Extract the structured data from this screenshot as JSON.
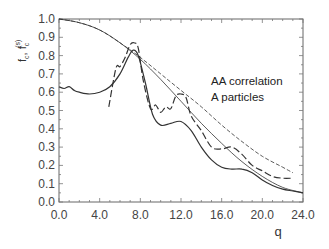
{
  "chart_data": {
    "type": "line",
    "title": "",
    "xlabel": "q",
    "ylabel": "f_c, f_c^(s)",
    "xlim": [
      0.0,
      24.0
    ],
    "ylim": [
      0.0,
      1.0
    ],
    "grid": false,
    "xticks": [
      "0.0",
      "4.0",
      "8.0",
      "12.0",
      "16.0",
      "20.0",
      "24.0"
    ],
    "yticks": [
      "0.0",
      "0.1",
      "0.2",
      "0.3",
      "0.4",
      "0.5",
      "0.6",
      "0.7",
      "0.8",
      "0.9",
      "1.0"
    ],
    "annotations": [
      "AA correlation",
      "A particles"
    ],
    "series": [
      {
        "name": "f_c^(s) (thin solid, Gaussian-like)",
        "style": "thin-solid",
        "x": [
          0,
          2,
          4,
          6,
          8,
          10,
          12,
          14,
          16,
          18,
          20,
          22,
          24
        ],
        "y": [
          1.0,
          0.98,
          0.94,
          0.87,
          0.78,
          0.67,
          0.55,
          0.43,
          0.32,
          0.22,
          0.14,
          0.08,
          0.05
        ]
      },
      {
        "name": "f_c^(s) (thin dashed)",
        "style": "thin-dashed",
        "x": [
          0,
          2,
          4,
          6,
          8,
          10,
          12,
          14,
          16,
          18,
          20,
          22,
          23
        ],
        "y": [
          1.0,
          0.98,
          0.94,
          0.87,
          0.79,
          0.7,
          0.61,
          0.52,
          0.42,
          0.33,
          0.25,
          0.19,
          0.16
        ]
      },
      {
        "name": "f_c (thick solid)",
        "style": "solid",
        "x": [
          0.0,
          0.5,
          1.0,
          1.5,
          2.0,
          3.0,
          4.0,
          5.0,
          6.0,
          6.8,
          7.3,
          7.8,
          8.5,
          9.2,
          10.0,
          11.0,
          12.0,
          13.0,
          14.0,
          15.0,
          16.0,
          17.0,
          18.0,
          19.0,
          20.0,
          21.0,
          22.0,
          23.0,
          24.0
        ],
        "y": [
          0.63,
          0.62,
          0.63,
          0.61,
          0.6,
          0.59,
          0.6,
          0.63,
          0.7,
          0.79,
          0.83,
          0.8,
          0.65,
          0.48,
          0.42,
          0.43,
          0.44,
          0.39,
          0.3,
          0.23,
          0.19,
          0.18,
          0.18,
          0.16,
          0.12,
          0.09,
          0.07,
          0.06,
          0.05
        ]
      },
      {
        "name": "f_c (thick dashed)",
        "style": "long-dashed",
        "x": [
          4.9,
          5.6,
          6.0,
          6.5,
          7.0,
          7.4,
          7.8,
          8.3,
          9.0,
          9.5,
          10.0,
          10.5,
          11.0,
          11.5,
          12.0,
          12.5,
          13.0,
          14.0,
          15.0,
          16.0,
          17.0,
          18.0,
          19.0,
          20.0,
          21.0,
          22.0,
          23.0
        ],
        "y": [
          0.52,
          0.73,
          0.74,
          0.79,
          0.86,
          0.87,
          0.84,
          0.66,
          0.51,
          0.53,
          0.49,
          0.52,
          0.51,
          0.58,
          0.59,
          0.57,
          0.47,
          0.39,
          0.3,
          0.29,
          0.3,
          0.26,
          0.2,
          0.17,
          0.14,
          0.13,
          0.13
        ]
      }
    ]
  },
  "axes": {
    "x_ticks": [
      {
        "label": "0.0"
      },
      {
        "label": "4.0"
      },
      {
        "label": "8.0"
      },
      {
        "label": "12.0"
      },
      {
        "label": "16.0"
      },
      {
        "label": "20.0"
      },
      {
        "label": "24.0"
      }
    ],
    "y_ticks": [
      {
        "label": "0.0"
      },
      {
        "label": "0.1"
      },
      {
        "label": "0.2"
      },
      {
        "label": "0.3"
      },
      {
        "label": "0.4"
      },
      {
        "label": "0.5"
      },
      {
        "label": "0.6"
      },
      {
        "label": "0.7"
      },
      {
        "label": "0.8"
      },
      {
        "label": "0.9"
      },
      {
        "label": "1.0"
      }
    ],
    "xlabel": "q",
    "ylabel_main": "f",
    "ylabel_sub1": "c",
    "ylabel_sep": ", f",
    "ylabel_sub2": "c",
    "ylabel_sup2": "(s)"
  },
  "annotation": {
    "line1": "AA correlation",
    "line2": "A particles"
  },
  "colors": {
    "axis": "#555555",
    "curve": "#333333",
    "text": "#444444",
    "background": "#ffffff"
  }
}
